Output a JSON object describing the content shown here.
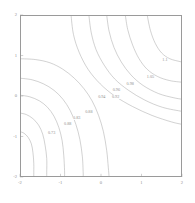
{
  "figure": {
    "title": "",
    "background_color": "#ffffff",
    "line_color": "#9a9a9a",
    "text_color": "#8f8f8f"
  },
  "chart_data": {
    "type": "line",
    "plot_kind": "contour",
    "title": "",
    "xlabel": "",
    "ylabel": "",
    "xlim": [
      -2,
      2
    ],
    "ylim": [
      -2,
      2
    ],
    "grid": false,
    "legend": "none",
    "xticks": [
      -2,
      -1,
      0,
      1,
      2
    ],
    "xticklabels": [
      "-2",
      "-1",
      "0",
      "1",
      "2"
    ],
    "yticks": [
      -2,
      -1,
      0,
      1,
      2
    ],
    "yticklabels": [
      "-2",
      "-1",
      "0",
      "1",
      "2"
    ],
    "contour_levels": [
      0.73,
      0.83,
      0.88,
      0.92,
      0.94,
      0.96,
      0.98,
      1.05,
      1.1
    ],
    "inline_labels": [
      {
        "text": "1.1",
        "x": 1.58,
        "y": 0.88
      },
      {
        "text": "1.05",
        "x": 1.22,
        "y": 0.48
      },
      {
        "text": "0.98",
        "x": 0.72,
        "y": 0.3
      },
      {
        "text": "0.96",
        "x": 0.38,
        "y": 0.16
      },
      {
        "text": "0.94",
        "x": 0.02,
        "y": -0.03
      },
      {
        "text": "0.92",
        "x": 0.36,
        "y": -0.03
      },
      {
        "text": "0.88",
        "x": -0.3,
        "y": -0.4
      },
      {
        "text": "0.83",
        "x": -0.6,
        "y": -0.55
      },
      {
        "text": "0.88",
        "x": -0.82,
        "y": -0.7
      },
      {
        "text": "0.73",
        "x": -1.22,
        "y": -0.92
      }
    ],
    "contours": [
      {
        "level": 1.1,
        "label": "1.1",
        "points": [
          [
            1.14,
            2.0
          ],
          [
            1.22,
            1.62
          ],
          [
            1.34,
            1.3
          ],
          [
            1.5,
            1.06
          ],
          [
            1.7,
            0.92
          ],
          [
            1.95,
            0.85
          ],
          [
            2.0,
            0.84
          ]
        ]
      },
      {
        "level": 1.05,
        "label": "1.05",
        "points": [
          [
            0.6,
            2.0
          ],
          [
            0.66,
            1.64
          ],
          [
            0.78,
            1.26
          ],
          [
            0.94,
            0.92
          ],
          [
            1.14,
            0.66
          ],
          [
            1.4,
            0.48
          ],
          [
            1.7,
            0.38
          ],
          [
            2.0,
            0.34
          ]
        ]
      },
      {
        "level": 0.98,
        "label": "0.98",
        "points": [
          [
            0.14,
            2.0
          ],
          [
            0.2,
            1.6
          ],
          [
            0.32,
            1.2
          ],
          [
            0.5,
            0.84
          ],
          [
            0.74,
            0.52
          ],
          [
            1.04,
            0.26
          ],
          [
            1.42,
            0.06
          ],
          [
            1.78,
            -0.04
          ],
          [
            2.0,
            -0.08
          ]
        ]
      },
      {
        "level": 0.96,
        "label": "0.96",
        "points": [
          [
            -0.3,
            2.0
          ],
          [
            -0.24,
            1.56
          ],
          [
            -0.12,
            1.14
          ],
          [
            0.08,
            0.76
          ],
          [
            0.34,
            0.42
          ],
          [
            0.68,
            0.14
          ],
          [
            1.08,
            -0.1
          ],
          [
            1.52,
            -0.28
          ],
          [
            2.0,
            -0.38
          ]
        ]
      },
      {
        "level": 0.94,
        "label": "0.94",
        "points": [
          [
            -0.74,
            2.0
          ],
          [
            -0.68,
            1.52
          ],
          [
            -0.54,
            1.08
          ],
          [
            -0.32,
            0.66
          ],
          [
            -0.02,
            0.3
          ],
          [
            0.34,
            0.0
          ],
          [
            0.78,
            -0.26
          ],
          [
            1.26,
            -0.48
          ],
          [
            1.74,
            -0.64
          ],
          [
            2.0,
            -0.7
          ]
        ]
      },
      {
        "level": 0.92,
        "label": "0.92",
        "points": [
          [
            -2.0,
            0.92
          ],
          [
            -1.62,
            0.9
          ],
          [
            -1.26,
            0.82
          ],
          [
            -0.94,
            0.66
          ],
          [
            -0.66,
            0.44
          ],
          [
            -0.42,
            0.18
          ],
          [
            -0.22,
            -0.12
          ],
          [
            -0.06,
            -0.48
          ],
          [
            0.06,
            -0.88
          ],
          [
            0.14,
            -1.34
          ],
          [
            0.18,
            -1.76
          ],
          [
            0.2,
            -2.0
          ]
        ]
      },
      {
        "level": 0.88,
        "label": "0.88",
        "points": [
          [
            -2.0,
            0.44
          ],
          [
            -1.7,
            0.4
          ],
          [
            -1.42,
            0.3
          ],
          [
            -1.16,
            0.14
          ],
          [
            -0.94,
            -0.08
          ],
          [
            -0.76,
            -0.36
          ],
          [
            -0.62,
            -0.7
          ],
          [
            -0.52,
            -1.08
          ],
          [
            -0.46,
            -1.5
          ],
          [
            -0.44,
            -1.9
          ],
          [
            -0.44,
            -2.0
          ]
        ]
      },
      {
        "level": 0.83,
        "label": "0.83",
        "points": [
          [
            -2.0,
            0.02
          ],
          [
            -1.76,
            -0.02
          ],
          [
            -1.52,
            -0.12
          ],
          [
            -1.32,
            -0.28
          ],
          [
            -1.16,
            -0.5
          ],
          [
            -1.04,
            -0.78
          ],
          [
            -0.96,
            -1.1
          ],
          [
            -0.92,
            -1.46
          ],
          [
            -0.9,
            -1.84
          ],
          [
            -0.9,
            -2.0
          ]
        ]
      },
      {
        "level": 0.78,
        "label": "",
        "points": [
          [
            -2.0,
            -0.42
          ],
          [
            -1.84,
            -0.46
          ],
          [
            -1.68,
            -0.56
          ],
          [
            -1.54,
            -0.72
          ],
          [
            -1.44,
            -0.94
          ],
          [
            -1.38,
            -1.22
          ],
          [
            -1.34,
            -1.54
          ],
          [
            -1.34,
            -1.88
          ],
          [
            -1.34,
            -2.0
          ]
        ]
      },
      {
        "level": 0.73,
        "label": "0.73",
        "points": [
          [
            -2.0,
            -0.88
          ],
          [
            -1.9,
            -0.92
          ],
          [
            -1.8,
            -1.02
          ],
          [
            -1.72,
            -1.18
          ],
          [
            -1.68,
            -1.4
          ],
          [
            -1.66,
            -1.66
          ],
          [
            -1.66,
            -1.94
          ],
          [
            -1.66,
            -2.0
          ]
        ]
      }
    ]
  }
}
